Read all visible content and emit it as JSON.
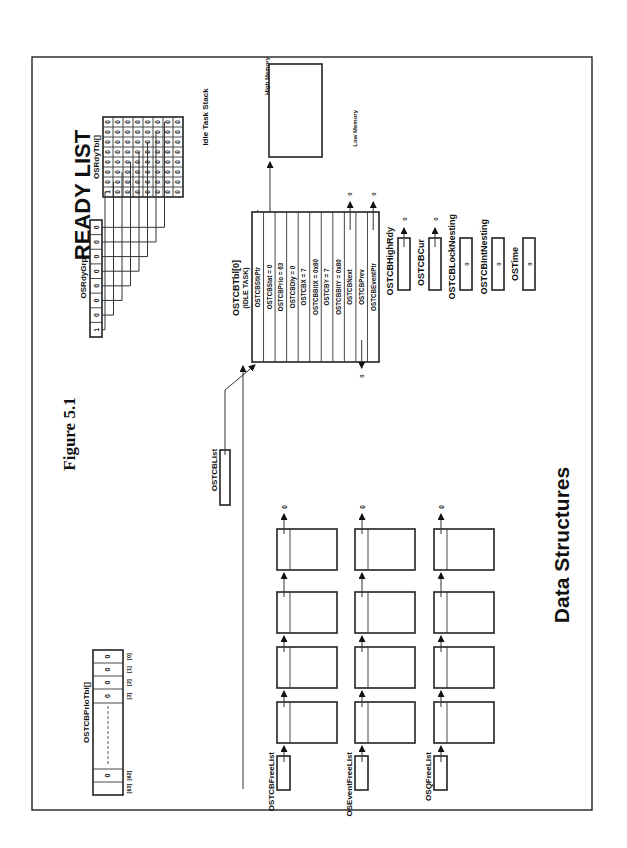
{
  "figure": {
    "title": "Figure 5.1",
    "heading": "READY LIST",
    "footer": "Data Structures"
  },
  "ready_list": {
    "grp_label": "OSRdyGrp",
    "grp_bits": [
      "1",
      "0",
      "0",
      "0",
      "0",
      "0",
      "0",
      "0"
    ],
    "tbl_label": "OSRdyTbl[]",
    "tbl_rows": [
      [
        "1",
        "0",
        "0",
        "0",
        "0",
        "0",
        "0",
        "0"
      ],
      [
        "0",
        "0",
        "0",
        "0",
        "0",
        "0",
        "0",
        "0"
      ],
      [
        "0",
        "0",
        "0",
        "0",
        "0",
        "0",
        "0",
        "0"
      ],
      [
        "0",
        "0",
        "0",
        "0",
        "0",
        "0",
        "0",
        "0"
      ],
      [
        "0",
        "0",
        "0",
        "0",
        "0",
        "0",
        "0",
        "0"
      ],
      [
        "0",
        "0",
        "0",
        "0",
        "0",
        "0",
        "0",
        "0"
      ],
      [
        "0",
        "0",
        "0",
        "0",
        "0",
        "0",
        "0",
        "0"
      ],
      [
        "0",
        "0",
        "0",
        "0",
        "0",
        "0",
        "0",
        "0"
      ]
    ]
  },
  "idle_stack": {
    "label": "Idle Task Stack",
    "high": "High Memory",
    "low": "Low Memory"
  },
  "tcb": {
    "label": "OSTCBTbl[0]",
    "sublabel": "(IDLE TASK)",
    "fields": [
      "OSTCBStkPtr",
      "OSTCBStat = 0",
      "OSTCBPrio = 63",
      "OSTCBDly = 0",
      "OSTCBX = 7",
      "OSTCBBitX = 0x80",
      "OSTCBY = 7",
      "OSTCBBitY = 0x80",
      "OSTCBNext",
      "OSTCBPrev",
      "OSTCBEventPtr"
    ],
    "null_value": "0"
  },
  "globals": {
    "high_rdy": {
      "label": "OSTCBHighRdy",
      "value": "0"
    },
    "cur": {
      "label": "OSTCBCur",
      "value": "0"
    },
    "lock_nesting": {
      "label": "OSTCBLockNesting",
      "value": "0"
    },
    "int_nesting": {
      "label": "OSTCBIntNesting",
      "value": "0"
    },
    "time": {
      "label": "OSTime",
      "value": "0"
    }
  },
  "tcb_list": {
    "label": "OSTCBList"
  },
  "free_lists": [
    {
      "label": "OSTCBFreeList",
      "null_value": "0"
    },
    {
      "label": "OSEventFreeList",
      "null_value": "0"
    },
    {
      "label": "OSQFreeList",
      "null_value": "0"
    }
  ],
  "prio_tbl": {
    "label": "OSTCBPrioTbl[]",
    "indices": [
      "[0]",
      "[1]",
      "[2]",
      "[3]",
      "[62]",
      "[63]"
    ],
    "values": [
      "0",
      "0",
      "0",
      "0",
      "0"
    ]
  }
}
